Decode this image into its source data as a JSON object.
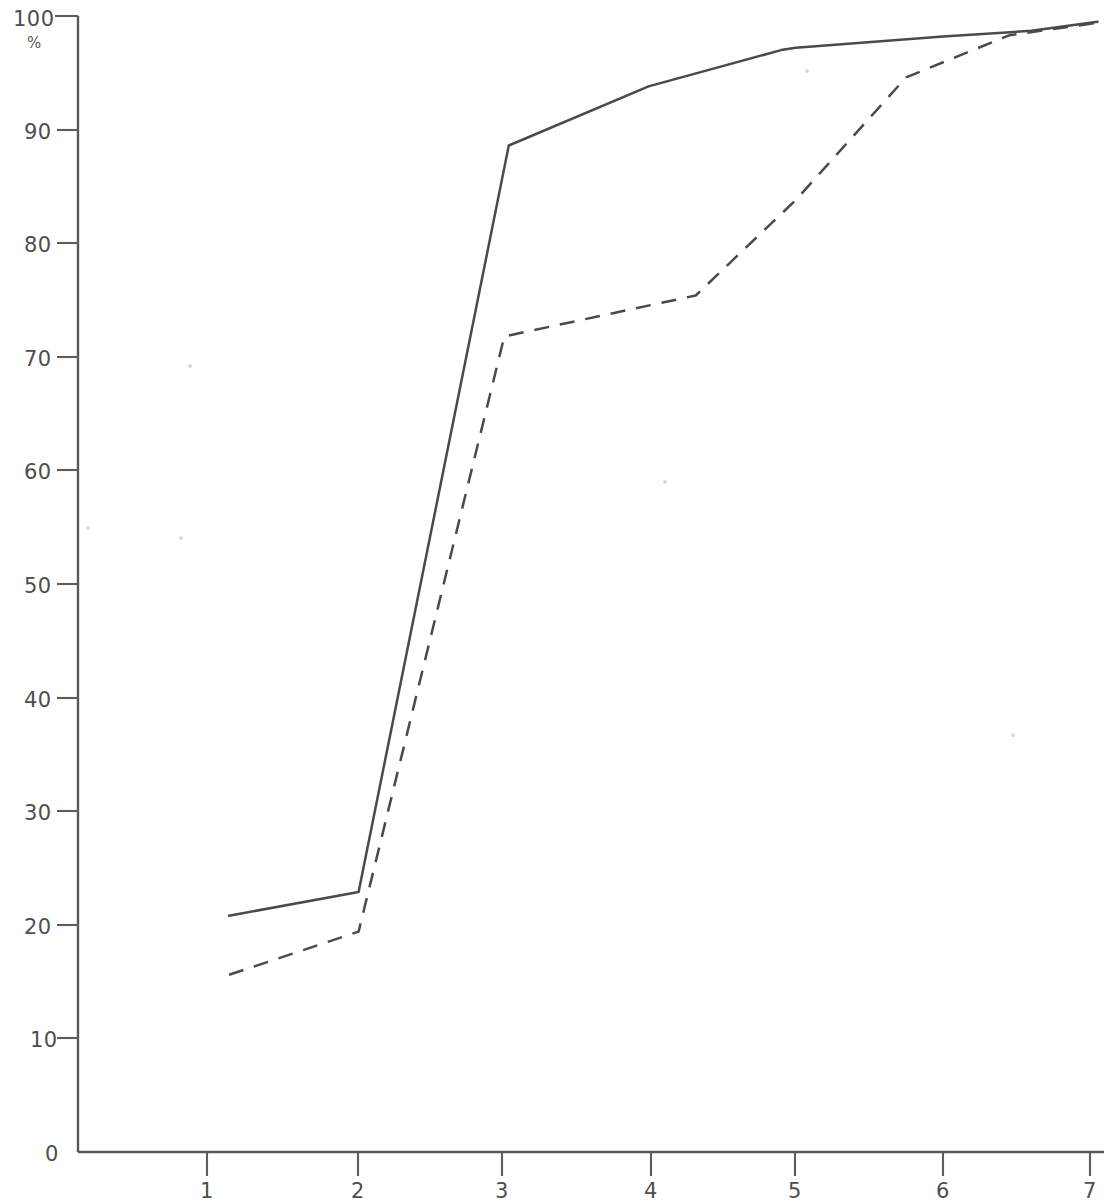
{
  "chart_data": {
    "type": "line",
    "title": "",
    "subtitle": "",
    "xlabel": "",
    "ylabel": "%",
    "xlim": [
      0,
      7.2
    ],
    "ylim": [
      0,
      100
    ],
    "grid": false,
    "legend": "none",
    "x_ticks": [
      "1",
      "2",
      "3",
      "4",
      "5",
      "6",
      "7"
    ],
    "x_tick_values": [
      1,
      2,
      3,
      4,
      5,
      6,
      7
    ],
    "y_ticks": [
      "0",
      "10",
      "20",
      "30",
      "40",
      "50",
      "60",
      "70",
      "80",
      "90",
      "100"
    ],
    "y_tick_values": [
      0,
      10,
      20,
      30,
      40,
      50,
      60,
      70,
      80,
      90,
      100
    ],
    "y_unit": "%",
    "series": [
      {
        "name": "solid-curve",
        "style": "solid",
        "color": "#4a4a4c",
        "x": [
          1.15,
          2.03,
          3.05,
          4.0,
          4.9,
          5.0,
          6.0,
          6.6,
          7.05
        ],
        "values": [
          20.8,
          22.9,
          88.6,
          93.8,
          97.0,
          97.2,
          98.2,
          98.7,
          99.5
        ]
      },
      {
        "name": "dashed-curve",
        "style": "dashed",
        "color": "#4a4a4c",
        "x": [
          1.15,
          2.03,
          3.02,
          4.32,
          5.0,
          5.75,
          6.45,
          7.05
        ],
        "values": [
          15.6,
          19.4,
          71.8,
          75.4,
          83.8,
          94.6,
          98.3,
          99.4
        ]
      }
    ]
  },
  "axes": {
    "origin_label": "0",
    "unit_label": "%"
  }
}
